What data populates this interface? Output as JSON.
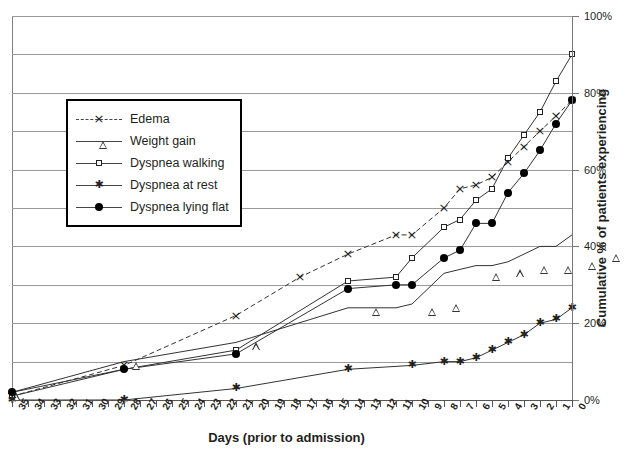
{
  "axes": {
    "xlabel": "Days (prior to admission)",
    "ylabel": "Cumulative % of patients experiencing",
    "xticks": [
      35,
      34,
      33,
      32,
      31,
      30,
      29,
      28,
      27,
      26,
      25,
      24,
      23,
      22,
      21,
      20,
      19,
      18,
      17,
      16,
      15,
      14,
      13,
      12,
      11,
      10,
      9,
      8,
      7,
      6,
      5,
      4,
      3,
      2,
      1,
      0
    ],
    "yticks": [
      "0%",
      "20%",
      "40%",
      "60%",
      "80%",
      "100%"
    ]
  },
  "legend": {
    "items": [
      {
        "label": "Edema",
        "marker": "x",
        "dashed": true
      },
      {
        "label": "Weight gain",
        "marker": "triangle",
        "dashed": false
      },
      {
        "label": "Dyspnea walking",
        "marker": "square",
        "dashed": false
      },
      {
        "label": "Dyspnea at rest",
        "marker": "asterisk",
        "dashed": false
      },
      {
        "label": "Dyspnea lying flat",
        "marker": "circle",
        "dashed": false
      }
    ]
  },
  "chart_data": {
    "type": "line",
    "title": "",
    "xlabel": "Days (prior to admission)",
    "ylabel": "Cumulative % of patients experiencing",
    "xlim": [
      35,
      0
    ],
    "ylim": [
      0,
      100
    ],
    "x_reversed": true,
    "grid": true,
    "legend_position": "upper-left-inset",
    "series": [
      {
        "name": "Edema",
        "marker": "x",
        "linestyle": "dashed",
        "points": [
          {
            "day": 35,
            "value": 1
          },
          {
            "day": 28,
            "value": 9
          },
          {
            "day": 21,
            "value": 22
          },
          {
            "day": 17,
            "value": 32
          },
          {
            "day": 14,
            "value": 38
          },
          {
            "day": 11,
            "value": 43
          },
          {
            "day": 10,
            "value": 43
          },
          {
            "day": 8,
            "value": 50
          },
          {
            "day": 7,
            "value": 55
          },
          {
            "day": 6,
            "value": 56
          },
          {
            "day": 5,
            "value": 58
          },
          {
            "day": 4,
            "value": 62
          },
          {
            "day": 3,
            "value": 66
          },
          {
            "day": 2,
            "value": 70
          },
          {
            "day": 1,
            "value": 74
          },
          {
            "day": 0,
            "value": 78
          }
        ]
      },
      {
        "name": "Weight gain",
        "marker": "triangle",
        "linestyle": "solid",
        "points": [
          {
            "day": 35,
            "value": 2
          },
          {
            "day": 28,
            "value": 10
          },
          {
            "day": 21,
            "value": 15
          },
          {
            "day": 14,
            "value": 24
          },
          {
            "day": 11,
            "value": 24
          },
          {
            "day": 10,
            "value": 25
          },
          {
            "day": 8,
            "value": 33
          },
          {
            "day": 7,
            "value": 34
          },
          {
            "day": 6,
            "value": 35
          },
          {
            "day": 5,
            "value": 35
          },
          {
            "day": 4,
            "value": 36
          },
          {
            "day": 3,
            "value": 38
          },
          {
            "day": 2,
            "value": 40
          },
          {
            "day": 1,
            "value": 40
          },
          {
            "day": 0,
            "value": 43
          }
        ]
      },
      {
        "name": "Dyspnea walking",
        "marker": "square",
        "linestyle": "solid",
        "points": [
          {
            "day": 35,
            "value": 1
          },
          {
            "day": 28,
            "value": 8
          },
          {
            "day": 21,
            "value": 13
          },
          {
            "day": 14,
            "value": 31
          },
          {
            "day": 11,
            "value": 32
          },
          {
            "day": 10,
            "value": 37
          },
          {
            "day": 8,
            "value": 45
          },
          {
            "day": 7,
            "value": 47
          },
          {
            "day": 6,
            "value": 52
          },
          {
            "day": 5,
            "value": 55
          },
          {
            "day": 4,
            "value": 63
          },
          {
            "day": 3,
            "value": 69
          },
          {
            "day": 2,
            "value": 75
          },
          {
            "day": 1,
            "value": 83
          },
          {
            "day": 0,
            "value": 90
          }
        ]
      },
      {
        "name": "Dyspnea at rest",
        "marker": "asterisk",
        "linestyle": "solid",
        "points": [
          {
            "day": 35,
            "value": 0
          },
          {
            "day": 28,
            "value": 0
          },
          {
            "day": 21,
            "value": 3
          },
          {
            "day": 14,
            "value": 8
          },
          {
            "day": 10,
            "value": 9
          },
          {
            "day": 8,
            "value": 10
          },
          {
            "day": 7,
            "value": 10
          },
          {
            "day": 6,
            "value": 11
          },
          {
            "day": 5,
            "value": 13
          },
          {
            "day": 4,
            "value": 15
          },
          {
            "day": 3,
            "value": 17
          },
          {
            "day": 2,
            "value": 20
          },
          {
            "day": 1,
            "value": 21
          },
          {
            "day": 0,
            "value": 24
          }
        ]
      },
      {
        "name": "Dyspnea lying flat",
        "marker": "circle",
        "linestyle": "solid",
        "points": [
          {
            "day": 35,
            "value": 2
          },
          {
            "day": 28,
            "value": 8
          },
          {
            "day": 21,
            "value": 12
          },
          {
            "day": 14,
            "value": 29
          },
          {
            "day": 11,
            "value": 30
          },
          {
            "day": 10,
            "value": 30
          },
          {
            "day": 8,
            "value": 37
          },
          {
            "day": 7,
            "value": 39
          },
          {
            "day": 6,
            "value": 46
          },
          {
            "day": 5,
            "value": 46
          },
          {
            "day": 4,
            "value": 54
          },
          {
            "day": 3,
            "value": 59
          },
          {
            "day": 2,
            "value": 65
          },
          {
            "day": 1,
            "value": 72
          },
          {
            "day": 0,
            "value": 78
          }
        ]
      }
    ]
  }
}
